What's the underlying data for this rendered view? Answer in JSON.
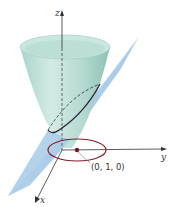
{
  "figure": {
    "axes": {
      "z_label": "z",
      "y_label": "y",
      "x_label": "x"
    },
    "point_label": "(0, 1, 0)",
    "colors": {
      "cone": "#b7dcd4",
      "cone_shade": "#8fc3b8",
      "plane": "#9cc3e4",
      "intersection_curve": "#2a2036",
      "projection_curve": "#8b1a2a",
      "point": "#7a1022",
      "axis": "#333333"
    }
  }
}
